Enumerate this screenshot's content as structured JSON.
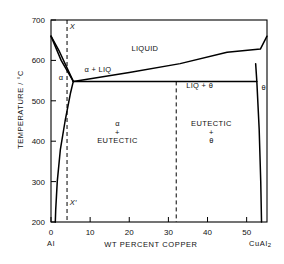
{
  "figure": {
    "kind": "binary-eutectic-phase-diagram",
    "system": "Al-Cu (aluminium rich end)"
  },
  "axes": {
    "y_title": "TEMPERATURE / °C",
    "x_title": "WT PERCENT COPPER",
    "y_ticks": [
      "700",
      "600",
      "500",
      "400",
      "300",
      "200"
    ],
    "y_values": [
      700,
      600,
      500,
      400,
      300,
      200
    ],
    "x_ticks": [
      "0",
      "10",
      "20",
      "30",
      "40",
      "50"
    ],
    "x_values": [
      0,
      10,
      20,
      30,
      40,
      50
    ],
    "x_left_end_label": "Al",
    "x_right_end_label": "CuAl",
    "x_right_end_sub": "2",
    "ylim": [
      200,
      700
    ],
    "xlim": [
      0,
      55.2
    ],
    "grid": false
  },
  "fields": {
    "liquid": "LIQUID",
    "alpha_plus_liq": "α + LIQ",
    "liq_plus_theta": "LIQ + θ",
    "alpha": "α",
    "theta": "θ",
    "alpha_eutectic_l1": "α",
    "alpha_eutectic_l2": "+",
    "alpha_eutectic_l3": "EUTECTIC",
    "eutectic_theta_l1": "EUTECTIC",
    "eutectic_theta_l2": "+",
    "eutectic_theta_l3": "θ"
  },
  "annotations": {
    "alloy_line_top": "X",
    "alloy_line_bottom": "X′"
  },
  "chart_data": {
    "type": "line",
    "title": "",
    "xlabel": "WT PERCENT COPPER",
    "ylabel": "TEMPERATURE / °C",
    "xlim": [
      0,
      55.2
    ],
    "ylim": [
      200,
      700
    ],
    "grid": false,
    "legend": null,
    "eutectic_point": {
      "composition_wt_pct_cu": 5.7,
      "temperature_C": 548
    },
    "al_melting_point": {
      "composition_wt_pct_cu": 0,
      "temperature_C": 660
    },
    "theta_composition_wt_pct_cu": 53.5,
    "series": [
      {
        "name": "liquidus (Al-rich)",
        "points": [
          [
            0,
            660
          ],
          [
            2.0,
            625
          ],
          [
            5.7,
            548
          ]
        ]
      },
      {
        "name": "liquidus (Cu-rich, toward CuAl2)",
        "points": [
          [
            5.7,
            548
          ],
          [
            20,
            570
          ],
          [
            33,
            592
          ],
          [
            45,
            620
          ],
          [
            53.5,
            628
          ],
          [
            55.2,
            660
          ]
        ]
      },
      {
        "name": "solidus (alpha)",
        "points": [
          [
            0,
            660
          ],
          [
            2.6,
            600
          ],
          [
            5.7,
            548
          ]
        ]
      },
      {
        "name": "alpha solvus",
        "points": [
          [
            5.7,
            548
          ],
          [
            5.0,
            520
          ],
          [
            3.6,
            450
          ],
          [
            2.4,
            380
          ],
          [
            1.6,
            300
          ],
          [
            1.2,
            230
          ],
          [
            1.1,
            200
          ]
        ]
      },
      {
        "name": "theta solvus (left boundary)",
        "points": [
          [
            52.3,
            592
          ],
          [
            52.6,
            548
          ],
          [
            53.2,
            430
          ],
          [
            53.6,
            300
          ],
          [
            53.8,
            200
          ]
        ]
      },
      {
        "name": "eutectic horizontal (548 °C)",
        "points": [
          [
            5.7,
            548
          ],
          [
            52.6,
            548
          ]
        ]
      },
      {
        "name": "alloy X composition (dashed)",
        "points": [
          [
            4.1,
            700
          ],
          [
            4.1,
            200
          ]
        ],
        "style": "dashed"
      },
      {
        "name": "eutectic composition (dashed)",
        "points": [
          [
            32.0,
            548
          ],
          [
            32.0,
            200
          ]
        ],
        "style": "dashed"
      }
    ]
  },
  "colors": {
    "line": "#000000",
    "background": "#ffffff",
    "text": "#111111"
  }
}
